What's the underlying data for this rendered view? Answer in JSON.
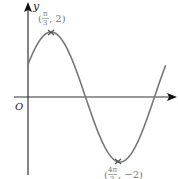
{
  "chart_data": {
    "type": "line",
    "title": "",
    "function": "y = 2 sin(x + π/6)",
    "xlabel": "x",
    "ylabel": "y",
    "origin_label": "O",
    "grid": false,
    "legend": null,
    "annotations": [
      {
        "label_num": "π",
        "label_den": "3",
        "label_y": "2",
        "x": 1.0472,
        "y": 2,
        "type": "maximum"
      },
      {
        "label_num": "4π",
        "label_den": "3",
        "label_y": "−2",
        "x": 4.1888,
        "y": -2,
        "type": "minimum"
      }
    ],
    "x": [
      0,
      0.5236,
      1.0472,
      1.5708,
      2.0944,
      2.618,
      3.1416,
      3.6652,
      4.1888,
      4.7124,
      5.236,
      5.7596
    ],
    "values": [
      1,
      1.732,
      2,
      1.732,
      1,
      0,
      -1,
      -1.732,
      -2,
      -1.732,
      -1,
      0
    ],
    "xlim": [
      -0.7,
      8.0
    ],
    "ylim": [
      -3.2,
      3.2
    ]
  },
  "labels": {
    "y_axis": "y",
    "origin": "O",
    "max_point": {
      "open": "(",
      "num": "π",
      "den": "3",
      "rest": ", 2)"
    },
    "min_point": {
      "open": "(",
      "num": "4π",
      "den": "3",
      "rest": ", −2)"
    }
  }
}
